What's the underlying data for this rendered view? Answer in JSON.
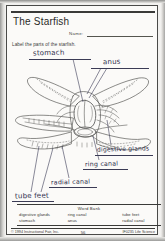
{
  "worksheet": {
    "title": "The Starfish",
    "name_label": "Name:",
    "name_value": "",
    "instruction": "Label the parts of the starfish."
  },
  "diagram": {
    "alt": "line drawing of a starfish with internal anatomy exposed",
    "labels": [
      {
        "id": "stomach",
        "text": "stomach"
      },
      {
        "id": "anus",
        "text": "anus"
      },
      {
        "id": "digestive_glands",
        "text": "digestive glands"
      },
      {
        "id": "ring_canal",
        "text": "ring canal"
      },
      {
        "id": "radial_canal",
        "text": "radial canal"
      },
      {
        "id": "tube_feet",
        "text": "tube feet"
      }
    ]
  },
  "word_bank": {
    "title": "Word Bank",
    "column1": [
      "digestive glands",
      "stomach"
    ],
    "column2": [
      "ring canal",
      "anus"
    ],
    "column3": [
      "tube feet",
      "radial canal"
    ]
  },
  "footer": {
    "copyright": "© 1994 Instructional Fair, Inc.",
    "page_number": "56",
    "code": "IF0235 Life Science"
  }
}
